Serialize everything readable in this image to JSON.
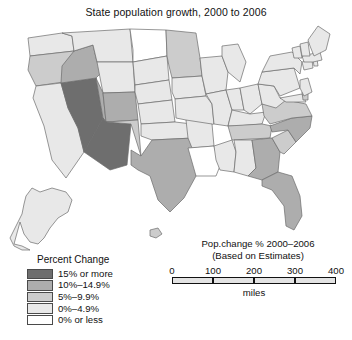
{
  "title": "State population growth, 2000 to 2006",
  "legend": {
    "title": "Percent Change",
    "classes": [
      {
        "label": "15% or more",
        "color": "#6e6e6e"
      },
      {
        "label": "10%–14.9%",
        "color": "#adadad"
      },
      {
        "label": "5%–9.9%",
        "color": "#cccccc"
      },
      {
        "label": "0%–4.9%",
        "color": "#e8e8e8"
      },
      {
        "label": "0% or less",
        "color": "#ffffff"
      }
    ]
  },
  "scale": {
    "caption_line1": "Pop.change % 2000–2006",
    "caption_line2": "(Based on Estimates)",
    "ticks": [
      "0",
      "100",
      "200",
      "300",
      "400"
    ],
    "unit": "miles"
  },
  "chart_data": {
    "type": "map",
    "title": "State population growth, 2000 to 2006",
    "subtitle": "Pop.change % 2000–2006 (Based on Estimates)",
    "variable": "Percent Change",
    "bins": [
      "0% or less",
      "0%–4.9%",
      "5%–9.9%",
      "10%–14.9%",
      "15% or more"
    ],
    "bin_colors": [
      "#ffffff",
      "#e8e8e8",
      "#cccccc",
      "#adadad",
      "#6e6e6e"
    ],
    "states": [
      {
        "name": "Washington",
        "abbr": "WA",
        "bin": "0%–4.9%"
      },
      {
        "name": "Oregon",
        "abbr": "OR",
        "bin": "5%–9.9%"
      },
      {
        "name": "California",
        "abbr": "CA",
        "bin": "0%–4.9%"
      },
      {
        "name": "Nevada",
        "abbr": "NV",
        "bin": "15% or more"
      },
      {
        "name": "Idaho",
        "abbr": "ID",
        "bin": "10%–14.9%"
      },
      {
        "name": "Montana",
        "abbr": "MT",
        "bin": "0%–4.9%"
      },
      {
        "name": "Wyoming",
        "abbr": "WY",
        "bin": "0%–4.9%"
      },
      {
        "name": "Utah",
        "abbr": "UT",
        "bin": "10%–14.9%"
      },
      {
        "name": "Arizona",
        "abbr": "AZ",
        "bin": "15% or more"
      },
      {
        "name": "Colorado",
        "abbr": "CO",
        "bin": "10%–14.9%"
      },
      {
        "name": "New Mexico",
        "abbr": "NM",
        "bin": "5%–9.9%"
      },
      {
        "name": "North Dakota",
        "abbr": "ND",
        "bin": "0% or less"
      },
      {
        "name": "South Dakota",
        "abbr": "SD",
        "bin": "0%–4.9%"
      },
      {
        "name": "Nebraska",
        "abbr": "NE",
        "bin": "0%–4.9%"
      },
      {
        "name": "Kansas",
        "abbr": "KS",
        "bin": "0%–4.9%"
      },
      {
        "name": "Oklahoma",
        "abbr": "OK",
        "bin": "0%–4.9%"
      },
      {
        "name": "Texas",
        "abbr": "TX",
        "bin": "10%–14.9%"
      },
      {
        "name": "Minnesota",
        "abbr": "MN",
        "bin": "5%–9.9%"
      },
      {
        "name": "Iowa",
        "abbr": "IA",
        "bin": "0%–4.9%"
      },
      {
        "name": "Missouri",
        "abbr": "MO",
        "bin": "0%–4.9%"
      },
      {
        "name": "Arkansas",
        "abbr": "AR",
        "bin": "0%–4.9%"
      },
      {
        "name": "Louisiana",
        "abbr": "LA",
        "bin": "0% or less"
      },
      {
        "name": "Wisconsin",
        "abbr": "WI",
        "bin": "0%–4.9%"
      },
      {
        "name": "Illinois",
        "abbr": "IL",
        "bin": "0%–4.9%"
      },
      {
        "name": "Michigan",
        "abbr": "MI",
        "bin": "0%–4.9%"
      },
      {
        "name": "Indiana",
        "abbr": "IN",
        "bin": "0%–4.9%"
      },
      {
        "name": "Ohio",
        "abbr": "OH",
        "bin": "0%–4.9%"
      },
      {
        "name": "Kentucky",
        "abbr": "KY",
        "bin": "0%–4.9%"
      },
      {
        "name": "Tennessee",
        "abbr": "TN",
        "bin": "5%–9.9%"
      },
      {
        "name": "Mississippi",
        "abbr": "MS",
        "bin": "0%–4.9%"
      },
      {
        "name": "Alabama",
        "abbr": "AL",
        "bin": "0%–4.9%"
      },
      {
        "name": "Georgia",
        "abbr": "GA",
        "bin": "10%–14.9%"
      },
      {
        "name": "Florida",
        "abbr": "FL",
        "bin": "10%–14.9%"
      },
      {
        "name": "South Carolina",
        "abbr": "SC",
        "bin": "5%–9.9%"
      },
      {
        "name": "North Carolina",
        "abbr": "NC",
        "bin": "10%–14.9%"
      },
      {
        "name": "Virginia",
        "abbr": "VA",
        "bin": "5%–9.9%"
      },
      {
        "name": "West Virginia",
        "abbr": "WV",
        "bin": "0%–4.9%"
      },
      {
        "name": "Maryland",
        "abbr": "MD",
        "bin": "0%–4.9%"
      },
      {
        "name": "Delaware",
        "abbr": "DE",
        "bin": "5%–9.9%"
      },
      {
        "name": "Pennsylvania",
        "abbr": "PA",
        "bin": "0%–4.9%"
      },
      {
        "name": "New Jersey",
        "abbr": "NJ",
        "bin": "0%–4.9%"
      },
      {
        "name": "New York",
        "abbr": "NY",
        "bin": "0%–4.9%"
      },
      {
        "name": "Connecticut",
        "abbr": "CT",
        "bin": "0%–4.9%"
      },
      {
        "name": "Rhode Island",
        "abbr": "RI",
        "bin": "0%–4.9%"
      },
      {
        "name": "Massachusetts",
        "abbr": "MA",
        "bin": "0%–4.9%"
      },
      {
        "name": "Vermont",
        "abbr": "VT",
        "bin": "0%–4.9%"
      },
      {
        "name": "New Hampshire",
        "abbr": "NH",
        "bin": "0%–4.9%"
      },
      {
        "name": "Maine",
        "abbr": "ME",
        "bin": "0%–4.9%"
      },
      {
        "name": "Alaska",
        "abbr": "AK",
        "bin": "0%–4.9%"
      },
      {
        "name": "Hawaii",
        "abbr": "HI",
        "bin": "5%–9.9%"
      }
    ]
  }
}
